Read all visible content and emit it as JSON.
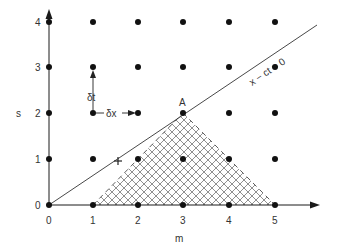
{
  "diagram": {
    "axes": {
      "x_label": "m",
      "y_label": "s",
      "x_ticks": [
        "0",
        "1",
        "2",
        "3",
        "4",
        "5"
      ],
      "y_ticks": [
        "0",
        "1",
        "2",
        "3",
        "4"
      ]
    },
    "characteristic_line_label": "x − ct = 0",
    "point_label": "A",
    "delta_t_label": "δt",
    "delta_x_label": "δx",
    "colors": {
      "ink": "#1a1a1a",
      "hatch": "#333333",
      "background": "#ffffff"
    }
  }
}
